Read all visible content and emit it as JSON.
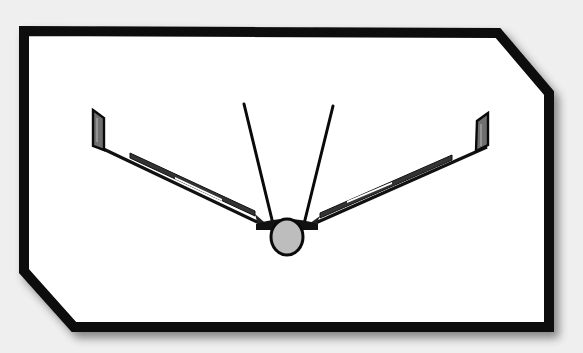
{
  "diagram": {
    "title": "",
    "colors": {
      "background": "#efefef",
      "frame_stroke": "#0a0a0a",
      "frame_fill": "#ffffff",
      "fuselage_fill": "#bdbdbd",
      "winglet_fill": "#777777",
      "line": "#111111"
    },
    "components": [
      {
        "id": "frame",
        "label": "Chamfered border frame"
      },
      {
        "id": "fuselage",
        "label": "Fuselage (circular cross-section)"
      },
      {
        "id": "left-wing",
        "label": "Left wing (dihedral)"
      },
      {
        "id": "right-wing",
        "label": "Right wing (dihedral)"
      },
      {
        "id": "left-winglet",
        "label": "Left winglet"
      },
      {
        "id": "right-winglet",
        "label": "Right winglet"
      },
      {
        "id": "left-tail-fin",
        "label": "Left V-tail fin"
      },
      {
        "id": "right-tail-fin",
        "label": "Right V-tail fin"
      }
    ]
  }
}
